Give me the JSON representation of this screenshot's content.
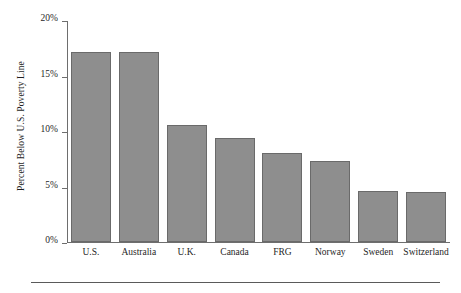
{
  "chart_data": {
    "type": "bar",
    "title": "",
    "xlabel": "",
    "ylabel": "Percent Below U.S. Poverty Line",
    "categories": [
      "U.S.",
      "Australia",
      "U.K.",
      "Canada",
      "FRG",
      "Norway",
      "Sweden",
      "Switzerland"
    ],
    "values": [
      17.1,
      17.1,
      10.5,
      9.4,
      8.0,
      7.3,
      4.6,
      4.5
    ],
    "ylim": [
      0,
      20
    ],
    "yticks": [
      0,
      5,
      10,
      15,
      20
    ],
    "ytick_labels": [
      "0%",
      "5%",
      "10%",
      "15%",
      "20%"
    ],
    "grid": false,
    "legend": "none",
    "bar_color": "#8e8e8e",
    "bar_edge_color": "#6a6a6a",
    "axis_color": "#6e6e6e"
  }
}
